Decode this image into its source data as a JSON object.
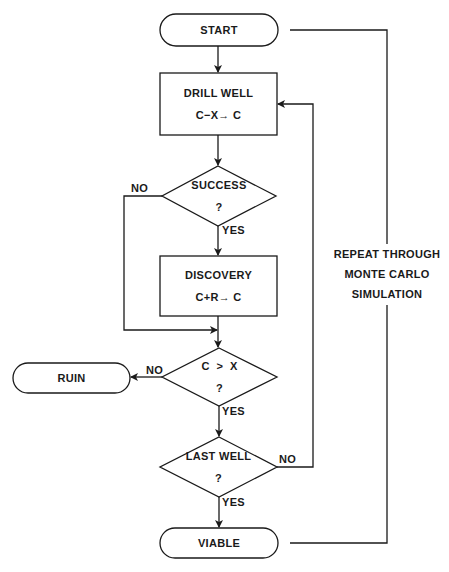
{
  "nodes": {
    "start": {
      "label": "START"
    },
    "drill_well": {
      "label": "DRILL WELL",
      "formula": "C−X→ C"
    },
    "success": {
      "label": "SUCCESS",
      "question": "?"
    },
    "discovery": {
      "label": "DISCOVERY",
      "formula": "C+R→ C"
    },
    "capital_check": {
      "label": "C  >  X",
      "question": "?"
    },
    "ruin": {
      "label": "RUIN"
    },
    "last_well": {
      "label": "LAST WELL",
      "question": "?"
    },
    "viable": {
      "label": "VIABLE"
    }
  },
  "edges": {
    "success_no": "NO",
    "success_yes": "YES",
    "capital_no": "NO",
    "capital_yes": "YES",
    "last_well_no": "NO",
    "last_well_yes": "YES"
  },
  "loop_note": {
    "line1": "REPEAT THROUGH",
    "line2": "MONTE CARLO",
    "line3": "SIMULATION"
  },
  "colors": {
    "stroke": "#1a1a1a",
    "background": "#ffffff"
  }
}
